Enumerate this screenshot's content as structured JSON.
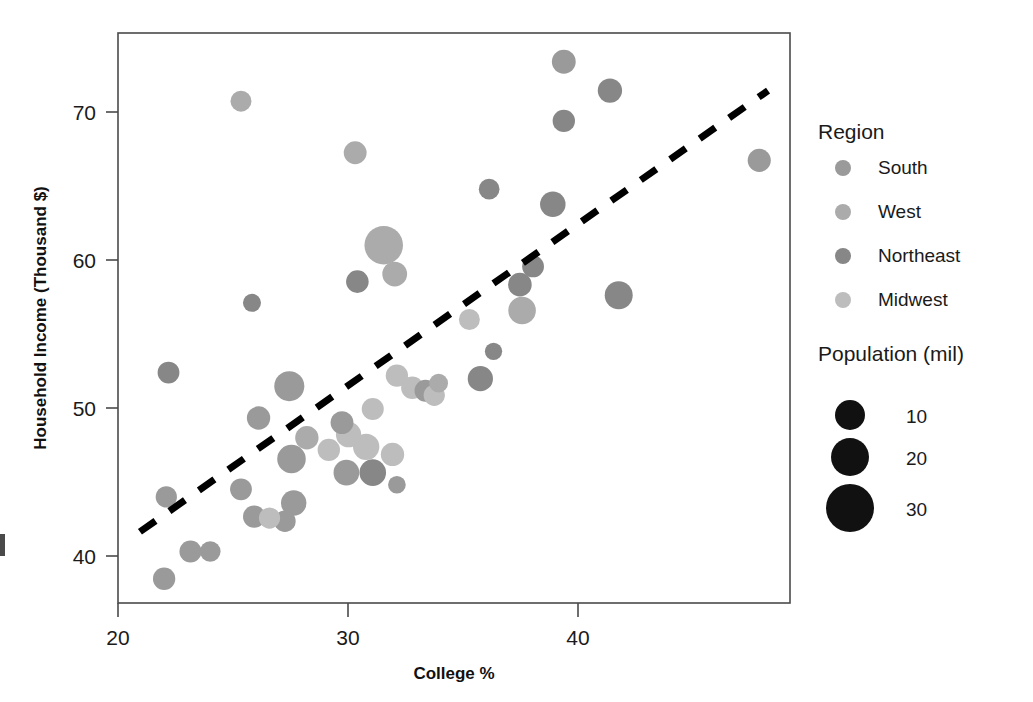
{
  "chart_data": {
    "type": "scatter",
    "title": "",
    "xlabel": "College %",
    "ylabel": "Household Income (Thousand $)",
    "xlim": [
      19.0,
      49.6
    ],
    "ylim": [
      37.6,
      75.2
    ],
    "xticks": [
      20,
      30,
      40
    ],
    "yticks": [
      40,
      50,
      60,
      70
    ],
    "grid": false,
    "size_label": "Population (mil)",
    "legend_position": "right",
    "series_key": "Region",
    "series": [
      {
        "name": "South",
        "color": "#9a9a9a"
      },
      {
        "name": "West",
        "color": "#ababab"
      },
      {
        "name": "Northeast",
        "color": "#878787"
      },
      {
        "name": "Midwest",
        "color": "#bdbdbd"
      }
    ],
    "size_legend": [
      {
        "label": "10",
        "value": 10,
        "r": 15
      },
      {
        "label": "20",
        "value": 20,
        "r": 19
      },
      {
        "label": "30",
        "value": 30,
        "r": 24
      }
    ],
    "trendline": {
      "x0": 20.0,
      "y0": 42.3,
      "x1": 48.6,
      "y1": 71.4,
      "style": "dashed"
    },
    "points": [
      {
        "x": 21.1,
        "y": 39.2,
        "pop": 3.0,
        "region": "South"
      },
      {
        "x": 21.3,
        "y": 52.8,
        "pop": 2.8,
        "region": "Northeast"
      },
      {
        "x": 21.2,
        "y": 44.6,
        "pop": 2.6,
        "region": "South"
      },
      {
        "x": 22.3,
        "y": 41.0,
        "pop": 2.9,
        "region": "South"
      },
      {
        "x": 23.2,
        "y": 41.0,
        "pop": 2.4,
        "region": "South"
      },
      {
        "x": 24.6,
        "y": 70.7,
        "pop": 2.5,
        "region": "West"
      },
      {
        "x": 24.6,
        "y": 45.1,
        "pop": 2.8,
        "region": "South"
      },
      {
        "x": 25.2,
        "y": 43.3,
        "pop": 3.0,
        "region": "South"
      },
      {
        "x": 25.1,
        "y": 57.4,
        "pop": 1.6,
        "region": "Northeast"
      },
      {
        "x": 25.4,
        "y": 49.8,
        "pop": 3.4,
        "region": "South"
      },
      {
        "x": 25.9,
        "y": 43.2,
        "pop": 2.6,
        "region": "Midwest"
      },
      {
        "x": 26.6,
        "y": 43.0,
        "pop": 2.7,
        "region": "South"
      },
      {
        "x": 26.8,
        "y": 51.9,
        "pop": 6.6,
        "region": "South"
      },
      {
        "x": 26.9,
        "y": 47.1,
        "pop": 5.8,
        "region": "South"
      },
      {
        "x": 27.0,
        "y": 44.2,
        "pop": 4.3,
        "region": "South"
      },
      {
        "x": 27.6,
        "y": 48.5,
        "pop": 3.4,
        "region": "West"
      },
      {
        "x": 28.6,
        "y": 47.7,
        "pop": 3.0,
        "region": "Midwest"
      },
      {
        "x": 29.2,
        "y": 49.5,
        "pop": 3.2,
        "region": "South"
      },
      {
        "x": 29.5,
        "y": 48.7,
        "pop": 4.2,
        "region": "Midwest"
      },
      {
        "x": 29.4,
        "y": 46.2,
        "pop": 4.4,
        "region": "South"
      },
      {
        "x": 29.8,
        "y": 67.3,
        "pop": 3.2,
        "region": "West"
      },
      {
        "x": 29.9,
        "y": 58.8,
        "pop": 3.1,
        "region": "Northeast"
      },
      {
        "x": 30.3,
        "y": 47.9,
        "pop": 4.7,
        "region": "Midwest"
      },
      {
        "x": 30.6,
        "y": 50.4,
        "pop": 2.9,
        "region": "Midwest"
      },
      {
        "x": 30.6,
        "y": 46.2,
        "pop": 4.8,
        "region": "Northeast"
      },
      {
        "x": 31.1,
        "y": 61.2,
        "pop": 12.2,
        "region": "West"
      },
      {
        "x": 31.5,
        "y": 47.4,
        "pop": 3.4,
        "region": "Midwest"
      },
      {
        "x": 31.6,
        "y": 59.3,
        "pop": 4.0,
        "region": "West"
      },
      {
        "x": 31.7,
        "y": 45.4,
        "pop": 1.5,
        "region": "South"
      },
      {
        "x": 31.7,
        "y": 52.6,
        "pop": 3.0,
        "region": "Midwest"
      },
      {
        "x": 32.4,
        "y": 51.8,
        "pop": 3.0,
        "region": "Midwest"
      },
      {
        "x": 33.0,
        "y": 51.6,
        "pop": 2.8,
        "region": "South"
      },
      {
        "x": 33.4,
        "y": 51.3,
        "pop": 2.6,
        "region": "Midwest"
      },
      {
        "x": 33.6,
        "y": 52.1,
        "pop": 1.8,
        "region": "West"
      },
      {
        "x": 35.0,
        "y": 56.3,
        "pop": 2.5,
        "region": "Midwest"
      },
      {
        "x": 35.5,
        "y": 52.4,
        "pop": 4.2,
        "region": "Northeast"
      },
      {
        "x": 35.9,
        "y": 64.9,
        "pop": 2.4,
        "region": "Northeast"
      },
      {
        "x": 36.1,
        "y": 54.2,
        "pop": 1.4,
        "region": "Northeast"
      },
      {
        "x": 37.3,
        "y": 58.6,
        "pop": 3.5,
        "region": "Northeast"
      },
      {
        "x": 37.4,
        "y": 56.9,
        "pop": 5.3,
        "region": "West"
      },
      {
        "x": 37.9,
        "y": 59.8,
        "pop": 2.8,
        "region": "Northeast"
      },
      {
        "x": 38.8,
        "y": 63.9,
        "pop": 4.3,
        "region": "Northeast"
      },
      {
        "x": 39.3,
        "y": 73.3,
        "pop": 3.6,
        "region": "South"
      },
      {
        "x": 39.3,
        "y": 69.4,
        "pop": 3.0,
        "region": "Northeast"
      },
      {
        "x": 41.4,
        "y": 71.4,
        "pop": 3.8,
        "region": "Northeast"
      },
      {
        "x": 41.8,
        "y": 57.9,
        "pop": 5.5,
        "region": "Northeast"
      },
      {
        "x": 48.2,
        "y": 66.8,
        "pop": 3.3,
        "region": "South"
      }
    ]
  },
  "legend": {
    "region_title": "Region",
    "items": [
      {
        "label": "South"
      },
      {
        "label": "West"
      },
      {
        "label": "Northeast"
      },
      {
        "label": "Midwest"
      }
    ],
    "size_title": "Population (mil)",
    "sizes": [
      {
        "label": "10"
      },
      {
        "label": "20"
      },
      {
        "label": "30"
      }
    ]
  },
  "axes": {
    "x_title": "College %",
    "y_title": "Household Income (Thousand $)",
    "x_ticks": [
      "20",
      "30",
      "40"
    ],
    "y_ticks": [
      "70",
      "60",
      "50",
      "40"
    ]
  }
}
